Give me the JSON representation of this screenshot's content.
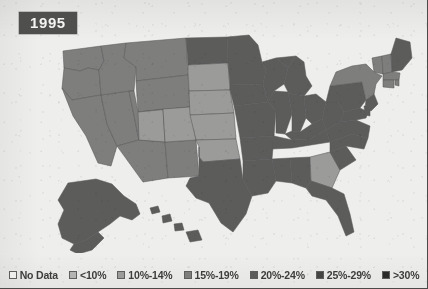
{
  "year_badge": "1995",
  "map": {
    "title": "1995",
    "no_data_fill": "#eeeeec",
    "ocean_fill": "#eeeeec",
    "border_stroke": "#58585a"
  },
  "legend": {
    "items": [
      {
        "label": "No Data",
        "color": "#eeeeec"
      },
      {
        "label": "<10%",
        "color": "#b4b4b2"
      },
      {
        "label": "10%-14%",
        "color": "#9b9b99"
      },
      {
        "label": "15%-19%",
        "color": "#7e7e7c"
      },
      {
        "label": "20%-24%",
        "color": "#5c5c5a"
      },
      {
        "label": "25%-29%",
        "color": "#454543"
      },
      {
        "label": ">30%",
        "color": "#2b2b29"
      }
    ]
  },
  "chart_data": {
    "type": "map",
    "title": "1995",
    "legend_position": "bottom",
    "categories": [
      "No Data",
      "<10%",
      "10%-14%",
      "15%-19%",
      "20%-24%",
      "25%-29%",
      ">30%"
    ],
    "category_colors": [
      "#eeeeec",
      "#b4b4b2",
      "#9b9b99",
      "#7e7e7c",
      "#5c5c5a",
      "#454543",
      "#2b2b29"
    ],
    "regions": [
      {
        "code": "WA",
        "name": "Washington",
        "category": "15%-19%"
      },
      {
        "code": "OR",
        "name": "Oregon",
        "category": "15%-19%"
      },
      {
        "code": "CA",
        "name": "California",
        "category": "15%-19%"
      },
      {
        "code": "NV",
        "name": "Nevada",
        "category": "15%-19%"
      },
      {
        "code": "ID",
        "name": "Idaho",
        "category": "15%-19%"
      },
      {
        "code": "MT",
        "name": "Montana",
        "category": "15%-19%"
      },
      {
        "code": "WY",
        "name": "Wyoming",
        "category": "15%-19%"
      },
      {
        "code": "UT",
        "name": "Utah",
        "category": "15%-19%"
      },
      {
        "code": "AZ",
        "name": "Arizona",
        "category": "15%-19%"
      },
      {
        "code": "NM",
        "name": "New Mexico",
        "category": "15%-19%"
      },
      {
        "code": "CO",
        "name": "Colorado",
        "category": "10%-14%"
      },
      {
        "code": "ND",
        "name": "North Dakota",
        "category": "20%-24%"
      },
      {
        "code": "SD",
        "name": "South Dakota",
        "category": "10%-14%"
      },
      {
        "code": "NE",
        "name": "Nebraska",
        "category": "10%-14%"
      },
      {
        "code": "KS",
        "name": "Kansas",
        "category": "10%-14%"
      },
      {
        "code": "OK",
        "name": "Oklahoma",
        "category": "10%-14%"
      },
      {
        "code": "TX",
        "name": "Texas",
        "category": "20%-24%"
      },
      {
        "code": "MN",
        "name": "Minnesota",
        "category": "20%-24%"
      },
      {
        "code": "IA",
        "name": "Iowa",
        "category": "20%-24%"
      },
      {
        "code": "MO",
        "name": "Missouri",
        "category": "20%-24%"
      },
      {
        "code": "AR",
        "name": "Arkansas",
        "category": "20%-24%"
      },
      {
        "code": "LA",
        "name": "Louisiana",
        "category": "20%-24%"
      },
      {
        "code": "WI",
        "name": "Wisconsin",
        "category": "20%-24%"
      },
      {
        "code": "IL",
        "name": "Illinois",
        "category": "20%-24%"
      },
      {
        "code": "MS",
        "name": "Mississippi",
        "category": "20%-24%"
      },
      {
        "code": "AL",
        "name": "Alabama",
        "category": "20%-24%"
      },
      {
        "code": "MI",
        "name": "Michigan",
        "category": "20%-24%"
      },
      {
        "code": "IN",
        "name": "Indiana",
        "category": "20%-24%"
      },
      {
        "code": "OH",
        "name": "Ohio",
        "category": "20%-24%"
      },
      {
        "code": "KY",
        "name": "Kentucky",
        "category": "20%-24%"
      },
      {
        "code": "TN",
        "name": "Tennessee",
        "category": "20%-24%"
      },
      {
        "code": "GA",
        "name": "Georgia",
        "category": "10%-14%"
      },
      {
        "code": "FL",
        "name": "Florida",
        "category": "20%-24%"
      },
      {
        "code": "SC",
        "name": "South Carolina",
        "category": "20%-24%"
      },
      {
        "code": "NC",
        "name": "North Carolina",
        "category": "20%-24%"
      },
      {
        "code": "VA",
        "name": "Virginia",
        "category": "20%-24%"
      },
      {
        "code": "WV",
        "name": "West Virginia",
        "category": "20%-24%"
      },
      {
        "code": "MD",
        "name": "Maryland",
        "category": "20%-24%"
      },
      {
        "code": "DE",
        "name": "Delaware",
        "category": "20%-24%"
      },
      {
        "code": "PA",
        "name": "Pennsylvania",
        "category": "20%-24%"
      },
      {
        "code": "NJ",
        "name": "New Jersey",
        "category": "20%-24%"
      },
      {
        "code": "NY",
        "name": "New York",
        "category": "15%-19%"
      },
      {
        "code": "CT",
        "name": "Connecticut",
        "category": "15%-19%"
      },
      {
        "code": "RI",
        "name": "Rhode Island",
        "category": "15%-19%"
      },
      {
        "code": "MA",
        "name": "Massachusetts",
        "category": "15%-19%"
      },
      {
        "code": "VT",
        "name": "Vermont",
        "category": "15%-19%"
      },
      {
        "code": "NH",
        "name": "New Hampshire",
        "category": "15%-19%"
      },
      {
        "code": "ME",
        "name": "Maine",
        "category": "20%-24%"
      },
      {
        "code": "AK",
        "name": "Alaska",
        "category": "20%-24%"
      },
      {
        "code": "HI",
        "name": "Hawaii",
        "category": "20%-24%"
      }
    ]
  }
}
